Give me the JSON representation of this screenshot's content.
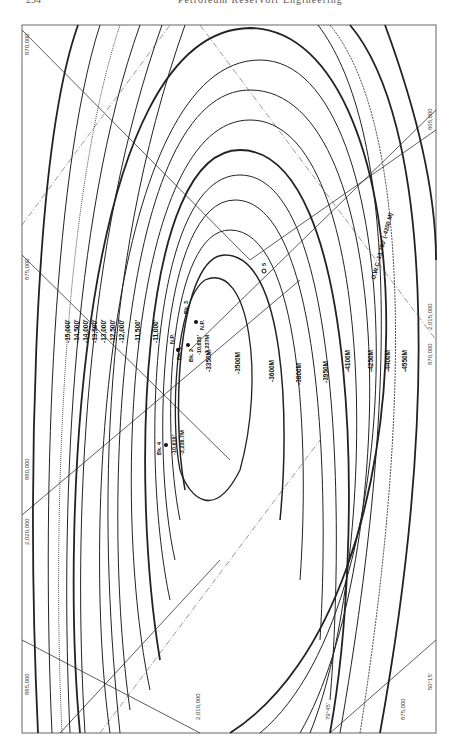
{
  "page_header": {
    "page_number": "294",
    "running_title": "Petroleum Reservoir Engineering"
  },
  "map": {
    "orientation": "rotated 90 degrees (labels read bottom-to-top)",
    "border_color": "#666666",
    "contour_color": "#222222",
    "subsea_contours_ft": [
      "-15,000'",
      "-14,500'",
      "-14,000'",
      "-13,500'",
      "-13,000'",
      "-12,500'",
      "-12,000'",
      "-11,500'",
      "-11,000'"
    ],
    "metric_contours": [
      "-3350M",
      "-3500M",
      "-3600M",
      "-3800M",
      "-3950M",
      "-4100M",
      "-4250M",
      "-4400M",
      "-4550M"
    ],
    "wells": [
      {
        "name": "Bk. 1",
        "status": "N.P."
      },
      {
        "name": "Bk. 2",
        "depth_ft": "-10,620'",
        "depth_m": "-3,237M"
      },
      {
        "name": "Bk. 3",
        "status": "N.P."
      },
      {
        "name": "Bk. 4",
        "depth_ft": "-10,619'",
        "depth_m": "-3,236.7M"
      },
      {
        "name": "5"
      }
    ],
    "owc_label": "O.W.C.-13,780' (-4200 M)",
    "grid_labels": {
      "top_left": "870,000",
      "top_right": "865,000",
      "left_upper": "875,000",
      "left_mid": "880,000",
      "left_lower": "2,020,000",
      "bottom_left": "885,000",
      "right_upper": "2,015,000",
      "right_mid": "870,000",
      "bottom_mid_1": "2,010,000",
      "bottom_mid_2": "875,000",
      "bottom_angle": "79°45'",
      "bottom_right": "50°15'"
    }
  }
}
